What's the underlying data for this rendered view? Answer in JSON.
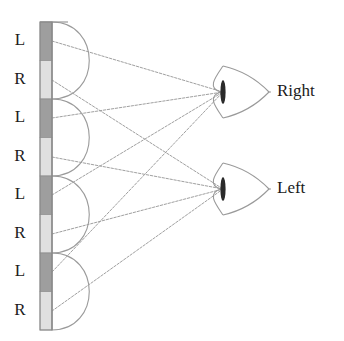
{
  "figure": {
    "background_color": "#ffffff"
  },
  "pixel_strip": {
    "name": "pixel-column-strip",
    "x": 40,
    "width": 12,
    "top": 22,
    "bottom": 330,
    "segment_height": 38.5,
    "outline_color": "#8a8a8a",
    "colors": {
      "left_pixel": "#9e9e9e",
      "right_pixel": "#e0e0e0"
    },
    "segments": [
      {
        "index": 0,
        "label": "L",
        "eye": "left",
        "fill": "#9e9e9e",
        "label_y": 41
      },
      {
        "index": 1,
        "label": "R",
        "eye": "right",
        "fill": "#e0e0e0",
        "label_y": 80
      },
      {
        "index": 2,
        "label": "L",
        "eye": "left",
        "fill": "#9e9e9e",
        "label_y": 118
      },
      {
        "index": 3,
        "label": "R",
        "eye": "right",
        "fill": "#e0e0e0",
        "label_y": 157
      },
      {
        "index": 4,
        "label": "L",
        "eye": "left",
        "fill": "#9e9e9e",
        "label_y": 195
      },
      {
        "index": 5,
        "label": "R",
        "eye": "right",
        "fill": "#e0e0e0",
        "label_y": 234
      },
      {
        "index": 6,
        "label": "L",
        "eye": "left",
        "fill": "#9e9e9e",
        "label_y": 272
      },
      {
        "index": 7,
        "label": "R",
        "eye": "right",
        "fill": "#e0e0e0",
        "label_y": 311
      }
    ],
    "label_x": 20
  },
  "lenticular_lenses": {
    "name": "lenticular-lens-array",
    "count": 4,
    "stroke_color": "#9a9a9a",
    "base_x": 52,
    "bulge": 36,
    "arcs": [
      {
        "index": 0,
        "top_y": 22,
        "bottom_y": 99
      },
      {
        "index": 1,
        "top_y": 99,
        "bottom_y": 176
      },
      {
        "index": 2,
        "top_y": 176,
        "bottom_y": 253
      },
      {
        "index": 3,
        "top_y": 253,
        "bottom_y": 330
      }
    ]
  },
  "viewpoints": [
    {
      "name": "right-eye-viewzone",
      "label": "Right",
      "focus_x": 223,
      "focus_y": 92,
      "label_x": 277,
      "label_y": 92,
      "bar_color": "#2a2a2a",
      "horn_color": "#9a9a9a"
    },
    {
      "name": "left-eye-viewzone",
      "label": "Left",
      "focus_x": 223,
      "focus_y": 189,
      "label_x": 277,
      "label_y": 189,
      "bar_color": "#2a2a2a",
      "horn_color": "#9a9a9a"
    }
  ],
  "rays": {
    "name": "ray-bundle",
    "stroke_color": "#a0a0a0",
    "origin_x": 52,
    "to_right": [
      {
        "from_segment": 0,
        "y": 41
      },
      {
        "from_segment": 2,
        "y": 118
      },
      {
        "from_segment": 4,
        "y": 195
      },
      {
        "from_segment": 6,
        "y": 272
      }
    ],
    "to_left": [
      {
        "from_segment": 1,
        "y": 80
      },
      {
        "from_segment": 3,
        "y": 157
      },
      {
        "from_segment": 5,
        "y": 234
      },
      {
        "from_segment": 7,
        "y": 311
      }
    ]
  }
}
